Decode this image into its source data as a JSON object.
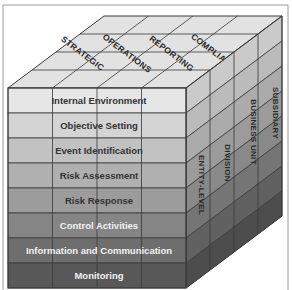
{
  "diagram": {
    "top_face": {
      "labels": [
        "STRATEGIC",
        "OPERATIONS",
        "REPORTING",
        "COMPLIANCE"
      ]
    },
    "front_face": {
      "rows": [
        {
          "label": "Internal Environment",
          "fill": "#e6e6e6",
          "text_color": "#333333"
        },
        {
          "label": "Objective Setting",
          "fill": "#d4d4d4",
          "text_color": "#333333"
        },
        {
          "label": "Event Identification",
          "fill": "#c2c2c2",
          "text_color": "#333333"
        },
        {
          "label": "Risk Assessment",
          "fill": "#b0b0b0",
          "text_color": "#333333"
        },
        {
          "label": "Risk Response",
          "fill": "#9c9c9c",
          "text_color": "#333333"
        },
        {
          "label": "Control Activities",
          "fill": "#858585",
          "text_color": "#f2f2f2"
        },
        {
          "label": "Information and Communication",
          "fill": "#6e6e6e",
          "text_color": "#f2f2f2"
        },
        {
          "label": "Monitoring",
          "fill": "#585858",
          "text_color": "#f2f2f2"
        }
      ]
    },
    "side_face": {
      "labels": [
        "ENTITY-LEVEL",
        "DIVISION",
        "BUSINESS UNIT",
        "SUBSIDIARY"
      ]
    },
    "colors": {
      "top_face": "#e2e2e2",
      "grid_line": "#3a3a3a",
      "frame_line": "#9a9a9a"
    }
  }
}
